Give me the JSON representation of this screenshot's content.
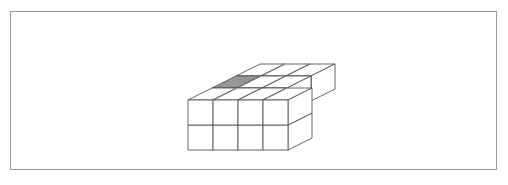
{
  "figure": {
    "frame": {
      "x": 10,
      "y": 11,
      "width": 487,
      "height": 159,
      "border_color": "#9a9a9a",
      "background": "#ffffff"
    },
    "palette": {
      "outline": "#555555",
      "face_default": "#ffffff",
      "face_shaded": "#969696",
      "frame_border": "#9a9a9a"
    },
    "projection": {
      "origin_x": 188,
      "origin_y": 150,
      "cube_width": 25,
      "cube_height": 25,
      "depth_dx": 24,
      "depth_dy": -12,
      "stroke_width": 0.9
    },
    "cubes": [
      {
        "id": "c1",
        "x": 0,
        "y": 0,
        "z": 0,
        "shaded": false
      },
      {
        "id": "c2",
        "x": 1,
        "y": 0,
        "z": 0,
        "shaded": false
      },
      {
        "id": "c3",
        "x": 2,
        "y": 0,
        "z": 0,
        "shaded": false
      },
      {
        "id": "c4",
        "x": 3,
        "y": 0,
        "z": 0,
        "shaded": false
      },
      {
        "id": "c5",
        "x": 0,
        "y": 0,
        "z": 1,
        "shaded": false
      },
      {
        "id": "c6",
        "x": 1,
        "y": 0,
        "z": 1,
        "shaded": false
      },
      {
        "id": "c7",
        "x": 2,
        "y": 0,
        "z": 1,
        "shaded": false
      },
      {
        "id": "c8",
        "x": 3,
        "y": 0,
        "z": 1,
        "shaded": false
      },
      {
        "id": "c9",
        "x": 0,
        "y": 1,
        "z": 1,
        "shaded": true
      },
      {
        "id": "c10",
        "x": 1,
        "y": 1,
        "z": 1,
        "shaded": false
      },
      {
        "id": "c11",
        "x": 2,
        "y": 1,
        "z": 1,
        "shaded": false
      },
      {
        "id": "c12",
        "x": 0,
        "y": 2,
        "z": 1,
        "shaded": false
      },
      {
        "id": "c13",
        "x": 1,
        "y": 2,
        "z": 1,
        "shaded": false
      },
      {
        "id": "c14",
        "x": 2,
        "y": 2,
        "z": 1,
        "shaded": false
      }
    ],
    "shaded_cube_id": "c9",
    "cube_count": 14
  }
}
